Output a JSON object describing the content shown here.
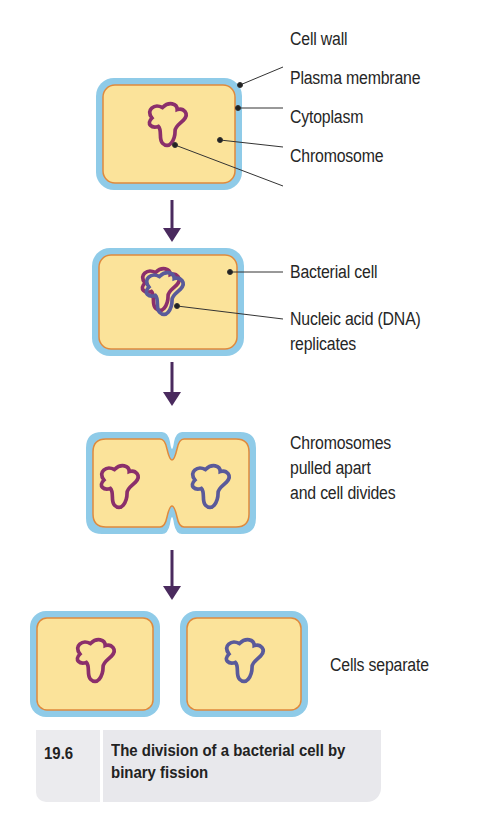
{
  "figure": {
    "number": "19.6",
    "caption": "The division of a bacterial cell by binary fission",
    "colors": {
      "cell_wall": "#8fcbe8",
      "plasma_membrane": "#e08a3c",
      "cytoplasm": "#fbe39a",
      "chromosome_a": "#8b2f6b",
      "chromosome_b": "#5a5a9a",
      "arrow": "#4a2a5e",
      "leader_line": "#333333",
      "caption_bg": "#e8e8ec"
    }
  },
  "stages": [
    {
      "id": "stage-1",
      "labels": [
        "Cell wall",
        "Plasma membrane",
        "Cytoplasm",
        "Chromosome"
      ]
    },
    {
      "id": "stage-2",
      "labels": [
        "Bacterial cell",
        "Nucleic acid (DNA)",
        "replicates"
      ]
    },
    {
      "id": "stage-3",
      "labels": [
        "Chromosomes",
        "pulled apart",
        "and cell divides"
      ]
    },
    {
      "id": "stage-4",
      "labels": [
        "Cells separate"
      ]
    }
  ]
}
